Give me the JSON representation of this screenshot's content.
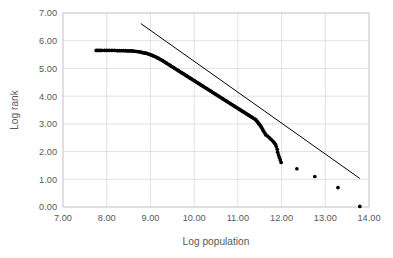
{
  "chart_data": {
    "type": "scatter",
    "title": "",
    "xlabel": "Log population",
    "ylabel": "Log rank",
    "xlim": [
      7.0,
      14.0
    ],
    "ylim": [
      0.0,
      7.0
    ],
    "xticks": [
      "7.00",
      "8.00",
      "9.00",
      "10.00",
      "11.00",
      "12.00",
      "13.00",
      "14.00"
    ],
    "yticks": [
      "0.00",
      "1.00",
      "2.00",
      "3.00",
      "4.00",
      "5.00",
      "6.00",
      "7.00"
    ],
    "xtick_values": [
      7,
      8,
      9,
      10,
      11,
      12,
      13,
      14
    ],
    "ytick_values": [
      0,
      1,
      2,
      3,
      4,
      5,
      6,
      7
    ],
    "grid": true,
    "legend": "none",
    "marker": "filled-circle",
    "marker_color": "#000000",
    "grid_color": "#d9d9d9",
    "series": [
      {
        "name": "Log rank vs Log population",
        "type": "scatter",
        "points": [
          [
            7.76,
            5.65
          ],
          [
            7.8,
            5.65
          ],
          [
            7.84,
            5.65
          ],
          [
            7.88,
            5.65
          ],
          [
            7.95,
            5.65
          ],
          [
            8.0,
            5.65
          ],
          [
            8.06,
            5.65
          ],
          [
            8.12,
            5.65
          ],
          [
            8.18,
            5.65
          ],
          [
            8.24,
            5.64
          ],
          [
            8.29,
            5.64
          ],
          [
            8.34,
            5.64
          ],
          [
            8.39,
            5.64
          ],
          [
            8.43,
            5.64
          ],
          [
            8.47,
            5.63
          ],
          [
            8.51,
            5.63
          ],
          [
            8.55,
            5.63
          ],
          [
            8.59,
            5.63
          ],
          [
            8.62,
            5.62
          ],
          [
            8.65,
            5.62
          ],
          [
            8.68,
            5.61
          ],
          [
            8.71,
            5.61
          ],
          [
            8.74,
            5.6
          ],
          [
            8.77,
            5.59
          ],
          [
            8.8,
            5.58
          ],
          [
            8.83,
            5.57
          ],
          [
            8.86,
            5.56
          ],
          [
            8.89,
            5.55
          ],
          [
            8.92,
            5.54
          ],
          [
            8.95,
            5.52
          ],
          [
            8.98,
            5.51
          ],
          [
            9.01,
            5.49
          ],
          [
            9.04,
            5.47
          ],
          [
            9.07,
            5.45
          ],
          [
            9.1,
            5.43
          ],
          [
            9.13,
            5.41
          ],
          [
            9.16,
            5.38
          ],
          [
            9.19,
            5.36
          ],
          [
            9.22,
            5.33
          ],
          [
            9.25,
            5.31
          ],
          [
            9.28,
            5.28
          ],
          [
            9.31,
            5.25
          ],
          [
            9.34,
            5.22
          ],
          [
            9.37,
            5.19
          ],
          [
            9.4,
            5.16
          ],
          [
            9.43,
            5.13
          ],
          [
            9.46,
            5.1
          ],
          [
            9.49,
            5.07
          ],
          [
            9.52,
            5.04
          ],
          [
            9.55,
            5.01
          ],
          [
            9.58,
            4.98
          ],
          [
            9.61,
            4.95
          ],
          [
            9.64,
            4.92
          ],
          [
            9.67,
            4.89
          ],
          [
            9.7,
            4.86
          ],
          [
            9.73,
            4.83
          ],
          [
            9.76,
            4.8
          ],
          [
            9.79,
            4.77
          ],
          [
            9.82,
            4.74
          ],
          [
            9.85,
            4.71
          ],
          [
            9.88,
            4.68
          ],
          [
            9.91,
            4.65
          ],
          [
            9.94,
            4.62
          ],
          [
            9.97,
            4.59
          ],
          [
            10.0,
            4.56
          ],
          [
            10.03,
            4.53
          ],
          [
            10.06,
            4.5
          ],
          [
            10.09,
            4.47
          ],
          [
            10.12,
            4.44
          ],
          [
            10.15,
            4.41
          ],
          [
            10.18,
            4.38
          ],
          [
            10.21,
            4.35
          ],
          [
            10.24,
            4.32
          ],
          [
            10.27,
            4.29
          ],
          [
            10.3,
            4.26
          ],
          [
            10.33,
            4.23
          ],
          [
            10.36,
            4.2
          ],
          [
            10.39,
            4.17
          ],
          [
            10.42,
            4.14
          ],
          [
            10.45,
            4.11
          ],
          [
            10.48,
            4.08
          ],
          [
            10.51,
            4.05
          ],
          [
            10.54,
            4.02
          ],
          [
            10.57,
            3.99
          ],
          [
            10.6,
            3.96
          ],
          [
            10.63,
            3.93
          ],
          [
            10.66,
            3.9
          ],
          [
            10.69,
            3.87
          ],
          [
            10.72,
            3.84
          ],
          [
            10.75,
            3.81
          ],
          [
            10.78,
            3.78
          ],
          [
            10.81,
            3.75
          ],
          [
            10.84,
            3.72
          ],
          [
            10.87,
            3.69
          ],
          [
            10.9,
            3.66
          ],
          [
            10.93,
            3.63
          ],
          [
            10.96,
            3.6
          ],
          [
            10.99,
            3.57
          ],
          [
            11.02,
            3.54
          ],
          [
            11.05,
            3.51
          ],
          [
            11.08,
            3.48
          ],
          [
            11.11,
            3.45
          ],
          [
            11.14,
            3.42
          ],
          [
            11.17,
            3.39
          ],
          [
            11.2,
            3.36
          ],
          [
            11.23,
            3.33
          ],
          [
            11.26,
            3.3
          ],
          [
            11.29,
            3.27
          ],
          [
            11.32,
            3.24
          ],
          [
            11.35,
            3.21
          ],
          [
            11.38,
            3.18
          ],
          [
            11.41,
            3.15
          ],
          [
            11.43,
            3.11
          ],
          [
            11.45,
            3.07
          ],
          [
            11.47,
            3.03
          ],
          [
            11.49,
            2.99
          ],
          [
            11.51,
            2.95
          ],
          [
            11.53,
            2.9
          ],
          [
            11.55,
            2.85
          ],
          [
            11.57,
            2.79
          ],
          [
            11.59,
            2.73
          ],
          [
            11.62,
            2.66
          ],
          [
            11.64,
            2.6
          ],
          [
            11.68,
            2.56
          ],
          [
            11.72,
            2.5
          ],
          [
            11.76,
            2.44
          ],
          [
            11.8,
            2.38
          ],
          [
            11.83,
            2.32
          ],
          [
            11.86,
            2.26
          ],
          [
            11.88,
            2.18
          ],
          [
            11.9,
            2.08
          ],
          [
            11.91,
            1.98
          ],
          [
            11.93,
            1.88
          ],
          [
            11.95,
            1.79
          ],
          [
            11.97,
            1.7
          ],
          [
            11.99,
            1.61
          ],
          [
            12.35,
            1.38
          ],
          [
            12.76,
            1.1
          ],
          [
            13.29,
            0.7
          ],
          [
            13.79,
            0.02
          ]
        ]
      }
    ],
    "trendline": {
      "name": "fitted power-law line",
      "color": "#000000",
      "x_start": 8.78,
      "y_start": 6.62,
      "x_end": 13.79,
      "y_end": 1.03,
      "slope": -1.116,
      "intercept": 16.42
    }
  }
}
